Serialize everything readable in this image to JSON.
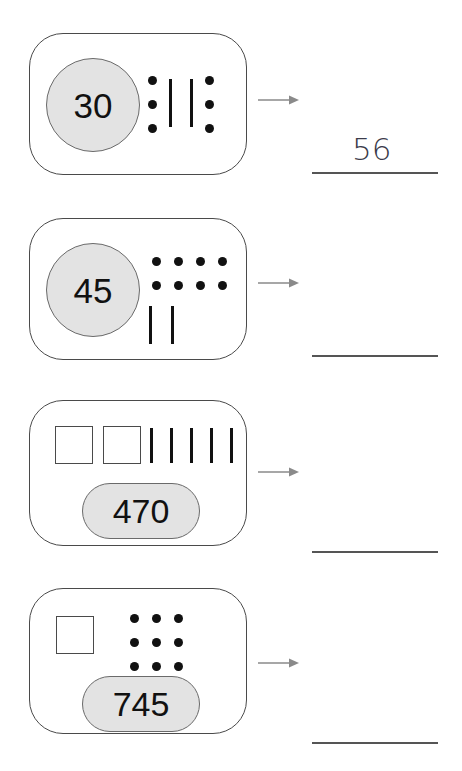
{
  "worksheet": {
    "background_color": "#ffffff",
    "badge_fill": "#e3e3e3",
    "badge_stroke": "#6a6a6a",
    "card_stroke": "#4a4a4a",
    "glyph_color": "#111111",
    "arrow_color": "#8a8a8a",
    "answer_line_color": "#555555",
    "handwriting_color": "#3b3b4a",
    "arrow_icon_name": "right-arrow-icon"
  },
  "problems": [
    {
      "id": "problem-1",
      "badge_value": "30",
      "badge_shape": "circle",
      "squares": 0,
      "dots": 6,
      "dot_columns": 2,
      "dot_rows": 3,
      "bars": 2,
      "bars_position": "between-dot-columns",
      "answer_value": "56",
      "answer_filled": true
    },
    {
      "id": "problem-2",
      "badge_value": "45",
      "badge_shape": "circle",
      "squares": 0,
      "dots": 8,
      "dot_columns": 4,
      "dot_rows": 2,
      "bars": 2,
      "bars_position": "below-dots",
      "answer_value": "",
      "answer_filled": false
    },
    {
      "id": "problem-3",
      "badge_value": "470",
      "badge_shape": "pill",
      "squares": 2,
      "dots": 0,
      "dot_columns": 0,
      "dot_rows": 0,
      "bars": 5,
      "bars_position": "right-of-squares",
      "answer_value": "",
      "answer_filled": false
    },
    {
      "id": "problem-4",
      "badge_value": "745",
      "badge_shape": "pill",
      "squares": 1,
      "dots": 9,
      "dot_columns": 3,
      "dot_rows": 3,
      "bars": 0,
      "bars_position": "none",
      "answer_value": "",
      "answer_filled": false
    }
  ]
}
